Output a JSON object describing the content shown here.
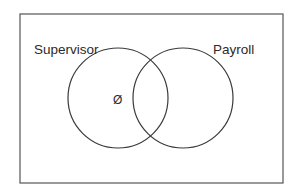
{
  "diagram": {
    "type": "venn",
    "universe": {
      "x": 20,
      "y": 14,
      "width": 263,
      "height": 169
    },
    "sets": [
      {
        "label": "Supervisor",
        "cx": 118,
        "cy": 98,
        "r": 50,
        "label_x": 34,
        "label_y": 54
      },
      {
        "label": "Payroll",
        "cx": 183,
        "cy": 98,
        "r": 50,
        "label_x": 213,
        "label_y": 54
      }
    ],
    "annotations": [
      {
        "text": "Ø",
        "region": "Supervisor only",
        "x": 113,
        "y": 104
      }
    ],
    "stroke_color": "#3a3a3a"
  }
}
